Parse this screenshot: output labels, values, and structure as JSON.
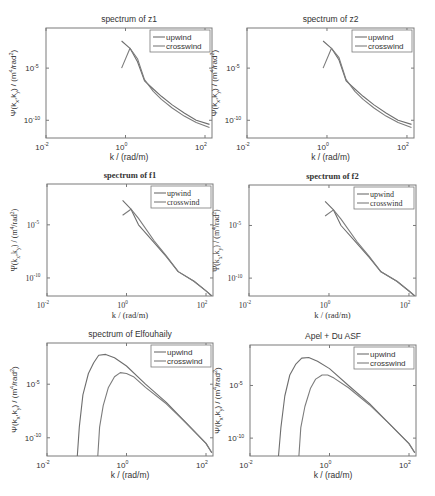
{
  "colors": {
    "axis": "#7a7a7a",
    "upwind": "#6e6e6e",
    "crosswind": "#7c7c7c",
    "text": "#333333"
  },
  "chart_data": [
    {
      "id": "z1",
      "type": "line",
      "title": "spectrum of z1",
      "font": "sans",
      "xlabel": "k / (rad/m)",
      "ylabel": "Ψ(k_x,k_y) / (m^4/rad^2)",
      "xscale": "log",
      "yscale": "log",
      "xlim": [
        0.01,
        150
      ],
      "ylim": [
        2e-12,
        0.07
      ],
      "xticks": [
        "10^-2",
        "10^0",
        "10^2"
      ],
      "yticks": [
        "10^-5",
        "10^-10"
      ],
      "legend": [
        "upwind",
        "crosswind"
      ],
      "legend_position": "northeast",
      "box": {
        "x": 46,
        "y": 28,
        "w": 166,
        "h": 110
      },
      "series": [
        {
          "name": "upwind",
          "x": [
            0.8,
            1.3,
            2,
            3,
            5,
            8,
            15,
            30,
            60,
            130
          ],
          "y": [
            0.004,
            0.0008,
            4e-05,
            6e-07,
            1e-07,
            2e-08,
            3e-09,
            5e-10,
            1e-10,
            4e-11
          ]
        },
        {
          "name": "crosswind",
          "x": [
            0.8,
            1.3,
            2,
            3,
            5,
            8,
            15,
            30,
            60,
            130
          ],
          "y": [
            1e-05,
            0.0008,
            8e-05,
            8e-07,
            6e-08,
            1e-08,
            1.5e-09,
            2.5e-10,
            6e-11,
            2e-11
          ]
        }
      ]
    },
    {
      "id": "z2",
      "type": "line",
      "title": "spectrum of z2",
      "font": "sans",
      "xlabel": "k / (rad/m)",
      "ylabel": "Ψ(k_x,k_y) / (m^4/rad^2)",
      "xscale": "log",
      "yscale": "log",
      "xlim": [
        0.01,
        150
      ],
      "ylim": [
        2e-12,
        0.07
      ],
      "xticks": [
        "10^-2",
        "10^0",
        "10^2"
      ],
      "yticks": [
        "10^-5",
        "10^-10"
      ],
      "legend": [
        "upwind",
        "crosswind"
      ],
      "legend_position": "northeast",
      "box": {
        "x": 247,
        "y": 28,
        "w": 167,
        "h": 110
      },
      "series": [
        {
          "name": "upwind",
          "x": [
            0.8,
            1.3,
            2,
            3,
            5,
            8,
            15,
            30,
            60,
            130
          ],
          "y": [
            0.004,
            0.0008,
            6e-05,
            6e-07,
            1e-07,
            2e-08,
            3e-09,
            5e-10,
            1e-10,
            4e-11
          ]
        },
        {
          "name": "crosswind",
          "x": [
            0.8,
            1.3,
            2,
            3,
            5,
            8,
            15,
            30,
            60,
            130
          ],
          "y": [
            1e-05,
            0.0008,
            0.0001,
            8e-07,
            6e-08,
            1e-08,
            1.5e-09,
            2.5e-10,
            6e-11,
            2e-11
          ]
        }
      ]
    },
    {
      "id": "f1",
      "type": "line",
      "title": "spectrum of f1",
      "font": "serif",
      "xlabel": "k / (rad/m)",
      "ylabel": "Ψ(k_x,k_y) / (m^4/rad^2)",
      "xscale": "log",
      "yscale": "log",
      "xlim": [
        0.01,
        150
      ],
      "ylim": [
        2e-12,
        0.07
      ],
      "xticks": [
        "10^-2",
        "10^0",
        "10^2"
      ],
      "yticks": [
        "10^-5",
        "10^-10"
      ],
      "legend": [
        "upwind",
        "crosswind"
      ],
      "legend_position": "northeast",
      "box": {
        "x": 47,
        "y": 184,
        "w": 166,
        "h": 112
      },
      "series": [
        {
          "name": "upwind",
          "x": [
            0.8,
            1.3,
            2,
            5,
            10,
            20,
            50,
            100,
            140
          ],
          "y": [
            0.002,
            0.0003,
            1e-05,
            2e-07,
            1e-08,
            4e-10,
            5e-11,
            6e-12,
            2e-12
          ]
        },
        {
          "name": "crosswind",
          "x": [
            0.8,
            1.3,
            2,
            5,
            10,
            20,
            50,
            100,
            140
          ],
          "y": [
            8e-05,
            0.0003,
            4e-05,
            3e-07,
            1.2e-08,
            4e-10,
            5e-11,
            6e-12,
            2e-12
          ]
        }
      ]
    },
    {
      "id": "f2",
      "type": "line",
      "title": "spectrum of f2",
      "font": "serif",
      "xlabel": "k / (rad/m)",
      "ylabel": "Ψ(k_x,k_y) / (m^4/rad^2)",
      "xscale": "log",
      "yscale": "log",
      "xlim": [
        0.01,
        150
      ],
      "ylim": [
        2e-12,
        0.07
      ],
      "xticks": [
        "10^-2",
        "10^0",
        "10^2"
      ],
      "yticks": [
        "10^-5",
        "10^-10"
      ],
      "legend": [
        "upwind",
        "crosswind"
      ],
      "legend_position": "northeast",
      "box": {
        "x": 249,
        "y": 185,
        "w": 167,
        "h": 111
      },
      "series": [
        {
          "name": "upwind",
          "x": [
            0.8,
            1.3,
            2,
            5,
            10,
            20,
            50,
            100,
            140
          ],
          "y": [
            0.002,
            0.0003,
            1e-05,
            2e-07,
            1e-08,
            4e-10,
            5e-11,
            6e-12,
            2e-12
          ]
        },
        {
          "name": "crosswind",
          "x": [
            0.8,
            1.3,
            2,
            5,
            10,
            20,
            50,
            100,
            140
          ],
          "y": [
            8e-05,
            0.0003,
            4e-05,
            3e-07,
            1.2e-08,
            4e-10,
            5e-11,
            6e-12,
            2e-12
          ]
        }
      ]
    },
    {
      "id": "elfouhaily",
      "type": "line",
      "title": "spectrum of Elfouhaily",
      "font": "sans",
      "xlabel": "k / (rad/m)",
      "ylabel": "Ψ(k_x,k_y) / (m^4/rad^2)",
      "xscale": "log",
      "yscale": "log",
      "xlim": [
        0.01,
        150
      ],
      "ylim": [
        2e-12,
        0.07
      ],
      "xticks": [
        "10^-2",
        "10^0",
        "10^2"
      ],
      "yticks": [
        "10^-5",
        "10^-10"
      ],
      "legend": [
        "upwind",
        "crosswind"
      ],
      "legend_position": "northeast",
      "box": {
        "x": 47,
        "y": 343,
        "w": 166,
        "h": 113
      },
      "series": [
        {
          "name": "upwind",
          "x": [
            0.058,
            0.065,
            0.08,
            0.11,
            0.15,
            0.2,
            0.3,
            0.5,
            1,
            3,
            10,
            30,
            100,
            140
          ],
          "y": [
            2e-12,
            1e-09,
            1e-06,
            0.0001,
            0.001,
            0.005,
            0.006,
            0.003,
            0.0005,
            1e-05,
            2e-07,
            3e-09,
            3e-11,
            4e-12
          ]
        },
        {
          "name": "crosswind",
          "x": [
            0.19,
            0.21,
            0.26,
            0.35,
            0.5,
            0.7,
            1,
            1.5,
            3,
            10,
            30,
            100,
            140
          ],
          "y": [
            2e-12,
            1e-09,
            1e-07,
            5e-06,
            5e-05,
            0.00012,
            0.0001,
            5e-05,
            5e-06,
            1.5e-07,
            3e-09,
            3e-11,
            4e-12
          ]
        }
      ]
    },
    {
      "id": "apel_du",
      "type": "line",
      "title": "Apel + Du ASF",
      "font": "sans",
      "xlabel": "k / (rad/m)",
      "ylabel": "Ψ(k_x,k_y) / (m^4/rad^2)",
      "xscale": "log",
      "yscale": "log",
      "xlim": [
        0.01,
        150
      ],
      "ylim": [
        2e-12,
        0.07
      ],
      "xticks": [
        "10^-2",
        "10^0",
        "10^2"
      ],
      "yticks": [
        "10^-5",
        "10^-10"
      ],
      "legend": [
        "upwind",
        "crosswind"
      ],
      "legend_position": "northeast",
      "box": {
        "x": 250,
        "y": 345,
        "w": 166,
        "h": 111
      },
      "series": [
        {
          "name": "upwind",
          "x": [
            0.052,
            0.06,
            0.075,
            0.1,
            0.14,
            0.2,
            0.3,
            0.5,
            1,
            3,
            10,
            30,
            100,
            140
          ],
          "y": [
            2e-12,
            1e-09,
            1e-06,
            0.0001,
            0.001,
            0.004,
            0.0045,
            0.002,
            0.0004,
            1e-05,
            2e-07,
            3e-09,
            3e-11,
            4e-12
          ]
        },
        {
          "name": "crosswind",
          "x": [
            0.17,
            0.19,
            0.24,
            0.33,
            0.45,
            0.65,
            0.9,
            1.3,
            3,
            10,
            30,
            100,
            140
          ],
          "y": [
            2e-12,
            1e-09,
            1e-07,
            5e-06,
            4e-05,
            0.0001,
            0.0001,
            5e-05,
            6e-06,
            1.5e-07,
            3e-09,
            3e-11,
            4e-12
          ]
        }
      ]
    }
  ]
}
